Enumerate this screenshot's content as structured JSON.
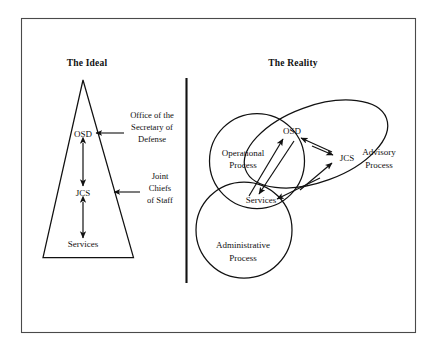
{
  "figure": {
    "caption_panels": [
      {
        "id": "ideal",
        "title": "The Ideal"
      },
      {
        "id": "reality",
        "title": "The Reality"
      }
    ]
  },
  "ideal": {
    "title": "The Ideal",
    "shape": "triangle",
    "nodes": [
      {
        "id": "osd",
        "label": "OSD"
      },
      {
        "id": "jcs",
        "label": "JCS"
      },
      {
        "id": "services",
        "label": "Services"
      }
    ],
    "annotations": [
      {
        "id": "osd-annot",
        "target": "osd",
        "lines": [
          "Office of the",
          "Secretary of",
          "Defense"
        ]
      },
      {
        "id": "jcs-annot",
        "target": "jcs",
        "lines": [
          "Joint",
          "Chiefs",
          "of Staff"
        ]
      }
    ],
    "links": [
      {
        "from": "osd",
        "to": "jcs",
        "style": "double-arrow"
      },
      {
        "from": "jcs",
        "to": "services",
        "style": "double-arrow"
      }
    ]
  },
  "reality": {
    "title": "The Reality",
    "regions": [
      {
        "id": "operational",
        "lines": [
          "Operational",
          "Process"
        ],
        "shape": "circle"
      },
      {
        "id": "administrative",
        "lines": [
          "Administrative",
          "Process"
        ],
        "shape": "circle"
      },
      {
        "id": "advisory",
        "lines": [
          "Advisory",
          "Process"
        ],
        "shape": "ellipse-rotated"
      }
    ],
    "nodes": [
      {
        "id": "osd",
        "label": "OSD"
      },
      {
        "id": "jcs",
        "label": "JCS"
      },
      {
        "id": "services",
        "label": "Services"
      }
    ],
    "links": [
      {
        "from": "jcs",
        "to": "osd",
        "style": "arrow"
      },
      {
        "from": "services",
        "to": "osd",
        "style": "arrow"
      },
      {
        "from": "osd",
        "to": "services",
        "style": "arrow"
      },
      {
        "from": "jcs",
        "to": "services",
        "style": "arrow"
      },
      {
        "from": "services",
        "to": "jcs",
        "style": "arrow"
      },
      {
        "from": "osd",
        "to": "jcs",
        "style": "arrow"
      }
    ]
  },
  "colors": {
    "ink": "#111111",
    "frame": "#4a4a4a",
    "background": "#ffffff"
  }
}
